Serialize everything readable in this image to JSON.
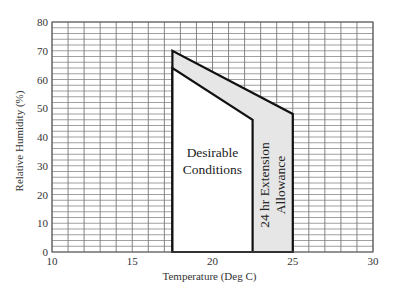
{
  "chart_data": {
    "type": "area",
    "title": "",
    "xlabel": "Temperature (Deg C)",
    "ylabel": "Relative Humidity (%)",
    "xlim": [
      10,
      30
    ],
    "ylim": [
      0,
      80
    ],
    "x_ticks": [
      10,
      15,
      20,
      25,
      30
    ],
    "y_ticks": [
      0,
      10,
      20,
      30,
      40,
      50,
      60,
      70,
      80
    ],
    "grid": {
      "on": true,
      "x_minor_step": 1,
      "y_minor_step": 2
    },
    "legend": "none",
    "regions": [
      {
        "name": "24 hr Extension Allowance",
        "label": "24 hr Extension Allowance",
        "label_lines": [
          "24 hr Extension",
          "Allowance"
        ],
        "fill": "#e6e6e6",
        "polygon": [
          [
            17.5,
            0
          ],
          [
            17.5,
            70
          ],
          [
            25,
            48
          ],
          [
            25,
            0
          ]
        ]
      },
      {
        "name": "Desirable Conditions",
        "label": "Desirable Conditions",
        "label_lines": [
          "Desirable",
          "Conditions"
        ],
        "fill": "#ffffff",
        "polygon": [
          [
            17.5,
            0
          ],
          [
            17.5,
            64
          ],
          [
            22.5,
            46
          ],
          [
            22.5,
            0
          ]
        ]
      }
    ]
  }
}
